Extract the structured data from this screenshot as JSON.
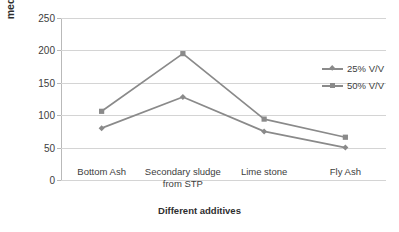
{
  "chart_data": {
    "type": "line",
    "title": "",
    "xlabel": "Different additives",
    "ylabel": "meq/100g",
    "categories": [
      "Bottom Ash",
      "Secondary sludge\nfrom STP",
      "Lime stone",
      "Fly Ash"
    ],
    "series": [
      {
        "name": "25% V/V",
        "values": [
          80,
          128,
          75,
          50
        ],
        "marker": "diamond",
        "color": "#8a8a8a"
      },
      {
        "name": "50% V/V",
        "values": [
          106,
          195,
          94,
          66
        ],
        "marker": "square",
        "color": "#8a8a8a"
      }
    ],
    "ylim": [
      0,
      250
    ],
    "yticks": [
      0,
      50,
      100,
      150,
      200,
      250
    ],
    "ytick_labels": [
      "0",
      "50",
      "100",
      "150",
      "200",
      "250"
    ],
    "grid": "horizontal",
    "legend_position": "right"
  },
  "axis": {
    "y_title": "meq/100g",
    "x_title": "Different additives"
  },
  "legend": {
    "entries": [
      {
        "label": "25% V/V"
      },
      {
        "label": "50% V/V"
      }
    ]
  },
  "colors": {
    "series": "#8a8a8a",
    "gridline": "#d4d4d4",
    "axis": "#b9b9b9",
    "text": "#3d3d3d",
    "background": "#ffffff"
  }
}
